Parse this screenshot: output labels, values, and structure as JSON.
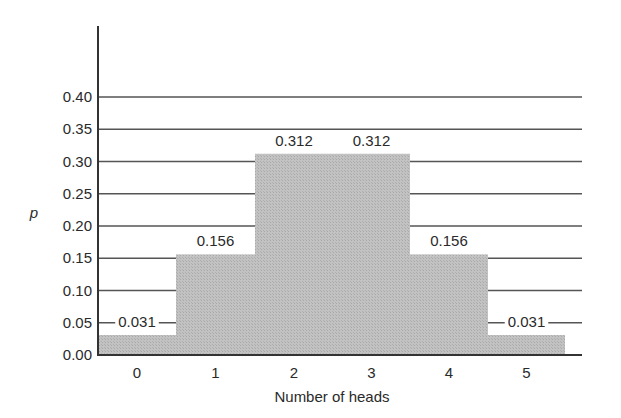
{
  "chart_data": {
    "type": "bar",
    "title": "",
    "xlabel": "Number of heads",
    "ylabel": "p",
    "categories": [
      "0",
      "1",
      "2",
      "3",
      "4",
      "5"
    ],
    "values": [
      0.031,
      0.156,
      0.312,
      0.312,
      0.156,
      0.031
    ],
    "value_labels": [
      "0.031",
      "0.156",
      "0.312",
      "0.312",
      "0.156",
      "0.031"
    ],
    "ylim": [
      0,
      0.4
    ],
    "yticks": [
      "0.00",
      "0.05",
      "0.10",
      "0.15",
      "0.20",
      "0.25",
      "0.30",
      "0.35",
      "0.40"
    ],
    "grid": true,
    "bar_width": "full (bars adjacent, histogram style)",
    "legend": null
  },
  "colors": {
    "bar": "#bdbdbd",
    "grid": "#555555",
    "axis": "#333333",
    "text": "#2a2a2a"
  }
}
